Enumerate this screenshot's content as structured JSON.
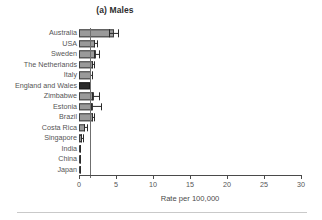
{
  "chart_data": {
    "type": "bar",
    "orientation": "horizontal",
    "title": "(a) Males",
    "xlabel": "Rate per 100,000",
    "ylabel": "",
    "xlim": [
      0,
      30
    ],
    "xticks": [
      0,
      5,
      10,
      15,
      20,
      25,
      30
    ],
    "grid": false,
    "legend": null,
    "reference_line": 1.5,
    "highlight_category": "England and Wales",
    "categories": [
      "Australia",
      "USA",
      "Sweden",
      "The Netherlands",
      "Italy",
      "England and Wales",
      "Zimbabwe",
      "Estonia",
      "Brazil",
      "Costa Rica",
      "Singapore",
      "India",
      "China",
      "Japan"
    ],
    "values": [
      4.7,
      2.2,
      2.3,
      1.9,
      1.6,
      1.5,
      2.0,
      1.9,
      1.9,
      0.8,
      0.4,
      0.2,
      0.2,
      0.2
    ],
    "error_low": [
      4.1,
      2.0,
      2.0,
      1.7,
      1.5,
      1.45,
      1.7,
      1.6,
      1.8,
      0.7,
      0.3,
      0.15,
      0.15,
      0.15
    ],
    "error_high": [
      5.4,
      2.5,
      2.8,
      2.2,
      1.8,
      1.6,
      2.8,
      3.1,
      2.1,
      1.2,
      0.7,
      0.3,
      0.3,
      0.3
    ],
    "colors": {
      "bar_fill": "#9a9a9a",
      "bar_edge": "#3d3d3d",
      "highlight_fill": "#2a2a2a",
      "axis": "#4a4a4a",
      "reference_line": "#6f6f6f",
      "text": "#555555"
    }
  }
}
